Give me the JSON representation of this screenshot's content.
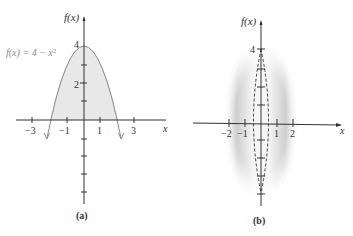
{
  "figure_a": {
    "caption": "(a)",
    "y_axis_label": "f(x)",
    "x_axis_label": "x",
    "function_label": "f(x) = 4 − x²",
    "y_ticks": [
      {
        "value": 4,
        "label": "4"
      },
      {
        "value": 2,
        "label": "2"
      }
    ],
    "x_ticks": [
      {
        "value": -3,
        "label": "−3"
      },
      {
        "value": -1,
        "label": "−1"
      },
      {
        "value": 1,
        "label": "1"
      },
      {
        "value": 3,
        "label": "3"
      }
    ],
    "fill_color": "#e8e8e8",
    "curve_color": "#8a8a8a"
  },
  "figure_b": {
    "caption": "(b)",
    "y_axis_label": "f(x)",
    "x_axis_label": "x",
    "y_ticks": [
      {
        "value": 4,
        "label": "4"
      }
    ],
    "x_ticks": [
      {
        "value": -2,
        "label": "−2"
      },
      {
        "value": -1,
        "label": "−1"
      },
      {
        "value": 1,
        "label": "1"
      },
      {
        "value": 2,
        "label": "2"
      }
    ],
    "description": "solid of revolution (shaded ellipsoid) with dashed inner profile"
  }
}
